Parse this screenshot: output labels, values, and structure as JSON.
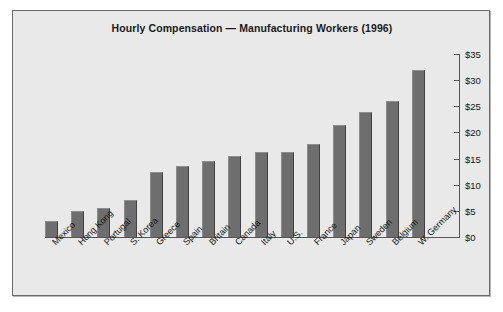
{
  "chart_data": {
    "type": "bar",
    "title": "Hourly Compensation — Manufacturing Workers (1996)",
    "xlabel": "",
    "ylabel": "",
    "ylim": [
      0,
      35
    ],
    "grid": false,
    "legend": "none",
    "y_axis_position": "right",
    "y_tick_labels": [
      "$0",
      "$5",
      "$10",
      "$15",
      "$20",
      "$25",
      "$30",
      "$35"
    ],
    "y_ticks": [
      0,
      5,
      10,
      15,
      20,
      25,
      30,
      35
    ],
    "categories": [
      "Mexico",
      "Hong Kong",
      "Portugal",
      "S. Korea",
      "Greece",
      "Spain",
      "Britain",
      "Canada",
      "Italy",
      "U.S.",
      "France",
      "Japan",
      "Sweden",
      "Belgium",
      "W. Germany"
    ],
    "values": [
      3.0,
      5.0,
      5.5,
      7.0,
      12.5,
      13.5,
      14.5,
      15.5,
      16.2,
      16.2,
      17.7,
      21.5,
      24.0,
      26.0,
      32.0
    ],
    "units": "US dollars per hour",
    "bar_color": "#6e6e6e",
    "panel_background": "#e9e9e9",
    "border_color": "#6a6a6a",
    "text_color": "#141414"
  }
}
